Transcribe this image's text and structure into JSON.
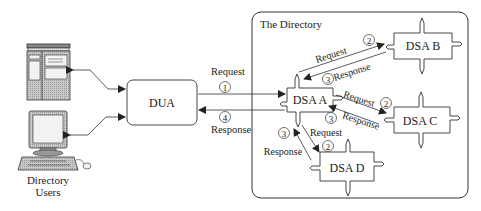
{
  "diagram": {
    "directory_label": "The Directory",
    "users_label_line1": "Directory",
    "users_label_line2": "Users",
    "dua_label": "DUA",
    "dsa": {
      "a": "DSA A",
      "b": "DSA B",
      "c": "DSA C",
      "d": "DSA D"
    },
    "links": {
      "dua_to_a_request": "Request",
      "dua_to_a_step": "1",
      "a_to_dua_response": "Response",
      "a_to_dua_step": "4",
      "a_to_b_request": "Request",
      "a_to_b_step": "2",
      "b_to_a_response": "Response",
      "b_to_a_step": "3",
      "a_to_c_request": "Request",
      "a_to_c_step": "2",
      "c_to_a_response": "Response",
      "c_to_a_step": "3",
      "a_to_d_request": "Request",
      "a_to_d_step": "2",
      "d_to_a_response": "Response",
      "d_to_a_step": "3"
    },
    "colors": {
      "line": "#333333",
      "device_fill": "#bdbdbd",
      "screen_fill": "#f2f2f2"
    }
  }
}
